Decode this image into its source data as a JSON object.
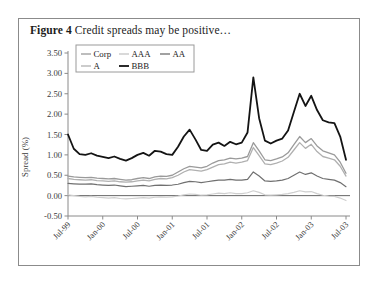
{
  "figure": {
    "label": "Figure 4",
    "caption": "Credit spreads may be positive…"
  },
  "legend": {
    "position": "top-left-inside",
    "items": [
      {
        "name": "Corp",
        "color": "#9a9a9a",
        "width": 1.3
      },
      {
        "name": "AAA",
        "color": "#c4c4c4",
        "width": 1.3
      },
      {
        "name": "AA",
        "color": "#6f6f6f",
        "width": 1.3
      },
      {
        "name": "A",
        "color": "#b0b0b0",
        "width": 1.3
      },
      {
        "name": "BBB",
        "color": "#141414",
        "width": 1.8
      }
    ]
  },
  "chart_data": {
    "type": "line",
    "title": "Credit spreads may be positive…",
    "xlabel": "",
    "ylabel": "Spread (%)",
    "ylim": [
      -0.5,
      3.5
    ],
    "ytick_step": 0.5,
    "yticks": [
      3.5,
      3.0,
      2.5,
      2.0,
      1.5,
      1.0,
      0.5,
      0.0,
      -0.5
    ],
    "ytick_labels": [
      "3.50",
      "3.00",
      "2.50",
      "2.00",
      "1.50",
      "1.00",
      "0.50",
      "0.00",
      "-0.50"
    ],
    "grid": false,
    "zero_line": true,
    "xticks": [
      "Jul-99",
      "Jan-00",
      "Jul-00",
      "Jan-01",
      "Jul-01",
      "Jan-02",
      "Jul-02",
      "Jan-03",
      "Jul-03"
    ],
    "xtick_rotation": -45,
    "x": [
      "Jul-99",
      "Aug-99",
      "Sep-99",
      "Oct-99",
      "Nov-99",
      "Dec-99",
      "Jan-00",
      "Feb-00",
      "Mar-00",
      "Apr-00",
      "May-00",
      "Jun-00",
      "Jul-00",
      "Aug-00",
      "Sep-00",
      "Oct-00",
      "Nov-00",
      "Dec-00",
      "Jan-01",
      "Feb-01",
      "Mar-01",
      "Apr-01",
      "May-01",
      "Jun-01",
      "Jul-01",
      "Aug-01",
      "Sep-01",
      "Oct-01",
      "Nov-01",
      "Dec-01",
      "Jan-02",
      "Feb-02",
      "Mar-02",
      "Apr-02",
      "May-02",
      "Jun-02",
      "Jul-02",
      "Aug-02",
      "Sep-02",
      "Oct-02",
      "Nov-02",
      "Dec-02",
      "Jan-03",
      "Feb-03",
      "Mar-03",
      "Apr-03",
      "May-03",
      "Jun-03",
      "Jul-03"
    ],
    "series": [
      {
        "name": "BBB",
        "color": "#141414",
        "width": 1.8,
        "values": [
          1.5,
          1.15,
          1.02,
          1.0,
          1.04,
          0.98,
          0.95,
          0.92,
          0.96,
          0.9,
          0.86,
          0.92,
          1.0,
          1.05,
          0.98,
          1.1,
          1.08,
          1.02,
          1.0,
          1.2,
          1.45,
          1.62,
          1.38,
          1.12,
          1.1,
          1.25,
          1.3,
          1.22,
          1.32,
          1.26,
          1.3,
          1.55,
          2.9,
          1.9,
          1.35,
          1.28,
          1.35,
          1.4,
          1.6,
          2.05,
          2.5,
          2.2,
          2.45,
          2.1,
          1.85,
          1.8,
          1.78,
          1.45,
          0.88
        ]
      },
      {
        "name": "Corp",
        "color": "#9a9a9a",
        "width": 1.3,
        "values": [
          0.48,
          0.46,
          0.45,
          0.44,
          0.45,
          0.43,
          0.42,
          0.41,
          0.42,
          0.4,
          0.38,
          0.39,
          0.42,
          0.44,
          0.42,
          0.46,
          0.48,
          0.47,
          0.5,
          0.58,
          0.66,
          0.72,
          0.7,
          0.68,
          0.72,
          0.8,
          0.86,
          0.88,
          0.92,
          0.9,
          0.92,
          0.96,
          1.3,
          1.1,
          0.88,
          0.86,
          0.9,
          0.95,
          1.05,
          1.25,
          1.45,
          1.3,
          1.4,
          1.22,
          1.1,
          1.05,
          1.0,
          0.82,
          0.55
        ]
      },
      {
        "name": "A",
        "color": "#b0b0b0",
        "width": 1.3,
        "values": [
          0.42,
          0.4,
          0.39,
          0.38,
          0.39,
          0.37,
          0.36,
          0.35,
          0.36,
          0.34,
          0.33,
          0.34,
          0.36,
          0.38,
          0.36,
          0.4,
          0.42,
          0.41,
          0.44,
          0.5,
          0.58,
          0.64,
          0.62,
          0.6,
          0.64,
          0.7,
          0.76,
          0.78,
          0.82,
          0.8,
          0.82,
          0.86,
          1.18,
          0.98,
          0.78,
          0.76,
          0.8,
          0.85,
          0.94,
          1.12,
          1.3,
          1.16,
          1.26,
          1.08,
          0.96,
          0.92,
          0.88,
          0.72,
          0.48
        ]
      },
      {
        "name": "AAA",
        "color": "#707070",
        "width": 1.2,
        "values": [
          0.3,
          0.29,
          0.28,
          0.28,
          0.29,
          0.27,
          0.26,
          0.25,
          0.26,
          0.24,
          0.22,
          0.23,
          0.24,
          0.25,
          0.23,
          0.25,
          0.26,
          0.25,
          0.26,
          0.28,
          0.32,
          0.35,
          0.34,
          0.32,
          0.34,
          0.36,
          0.38,
          0.38,
          0.4,
          0.38,
          0.38,
          0.4,
          0.58,
          0.48,
          0.36,
          0.35,
          0.36,
          0.38,
          0.42,
          0.5,
          0.58,
          0.52,
          0.56,
          0.48,
          0.42,
          0.4,
          0.38,
          0.32,
          0.22
        ]
      },
      {
        "name": "AA",
        "color": "#cfcfcf",
        "width": 1.2,
        "values": [
          0.02,
          0.0,
          -0.02,
          -0.03,
          -0.02,
          -0.04,
          -0.05,
          -0.06,
          -0.05,
          -0.07,
          -0.08,
          -0.07,
          -0.06,
          -0.05,
          -0.06,
          -0.04,
          -0.03,
          -0.04,
          -0.03,
          -0.01,
          0.02,
          0.04,
          0.03,
          0.01,
          0.02,
          0.04,
          0.06,
          0.05,
          0.07,
          0.05,
          0.05,
          0.07,
          0.12,
          0.08,
          0.02,
          0.01,
          0.02,
          0.03,
          0.05,
          0.08,
          0.12,
          0.09,
          0.1,
          0.05,
          0.01,
          -0.01,
          -0.02,
          -0.06,
          -0.12
        ]
      }
    ]
  }
}
